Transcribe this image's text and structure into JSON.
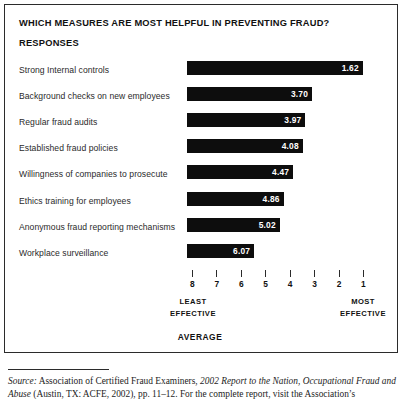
{
  "chart_data": {
    "type": "bar",
    "orientation": "horizontal",
    "title": "WHICH MEASURES ARE MOST HELPFUL IN PREVENTING FRAUD?",
    "subheader": "RESPONSES",
    "xlabel": "AVERAGE",
    "ylabel": "",
    "xlim": [
      8,
      1
    ],
    "axis_reversed": true,
    "axis_note_low": "LEAST EFFECTIVE",
    "axis_note_high": "MOST EFFECTIVE",
    "tick_labels": [
      "8",
      "7",
      "6",
      "5",
      "4",
      "3",
      "2",
      "1"
    ],
    "grid": false,
    "legend": "none",
    "bar_color": "#0d0d0d",
    "categories": [
      "Strong Internal controls",
      "Background checks on new employees",
      "Regular fraud audits",
      "Established fraud policies",
      "Willingness of companies to prosecute",
      "Ethics training for employees",
      "Anonymous fraud reporting mechanisms",
      "Workplace surveillance"
    ],
    "values": [
      1.62,
      3.7,
      3.97,
      4.08,
      4.47,
      4.86,
      5.02,
      6.07
    ],
    "value_labels": [
      "1.62",
      "3.70",
      "3.97",
      "4.08",
      "4.47",
      "4.86",
      "5.02",
      "6.07"
    ]
  },
  "axis": {
    "least_effective_line1": "LEAST",
    "least_effective_line2": "EFFECTIVE",
    "most_effective_line1": "MOST",
    "most_effective_line2": "EFFECTIVE",
    "average_caption": "AVERAGE"
  },
  "source": {
    "lead": "Source:",
    "text_part1": " Association of Certified Fraud Examiners, ",
    "italic_title": "2002 Report to the Nation, Occupational Fraud and Abuse",
    "text_part2": " (Austin, TX: ACFE, 2002), pp. 11–12. For the complete report, visit the Association’s"
  }
}
